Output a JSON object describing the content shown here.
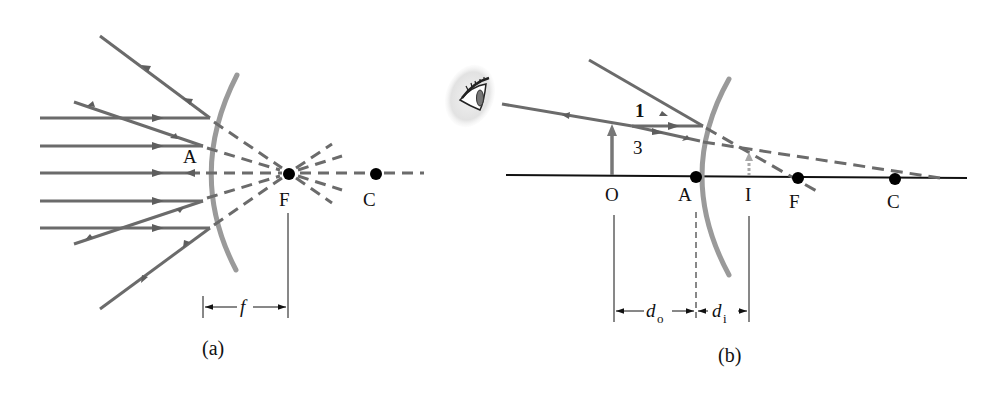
{
  "colors": {
    "ray": "#6b6b6b",
    "mirror": "#9a9a9a",
    "axis": "#111111",
    "point": "#000000",
    "image_arrow": "#a8a8a8",
    "background": "#ffffff"
  },
  "panel_a": {
    "caption": "(a)",
    "labels": {
      "vertex": "A",
      "focal_point": "F",
      "center": "C",
      "focal_length": "f"
    }
  },
  "panel_b": {
    "caption": "(b)",
    "labels": {
      "object": "O",
      "vertex": "A",
      "image": "I",
      "focal_point": "F",
      "center": "C",
      "ray1": "1",
      "ray3": "3",
      "object_distance_symbol": "d",
      "object_distance_sub": "o",
      "image_distance_symbol": "d",
      "image_distance_sub": "i"
    },
    "icons": {
      "observer": "eye-icon"
    }
  }
}
